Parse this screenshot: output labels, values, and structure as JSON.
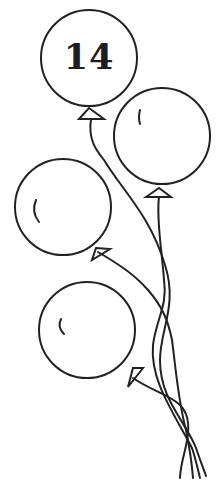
{
  "illustration": {
    "description": "Line drawing of four balloons with tangled strings",
    "top_balloon_number": "14",
    "balloon_count": 4,
    "colors": {
      "line": "#222222",
      "background": "#ffffff"
    }
  }
}
